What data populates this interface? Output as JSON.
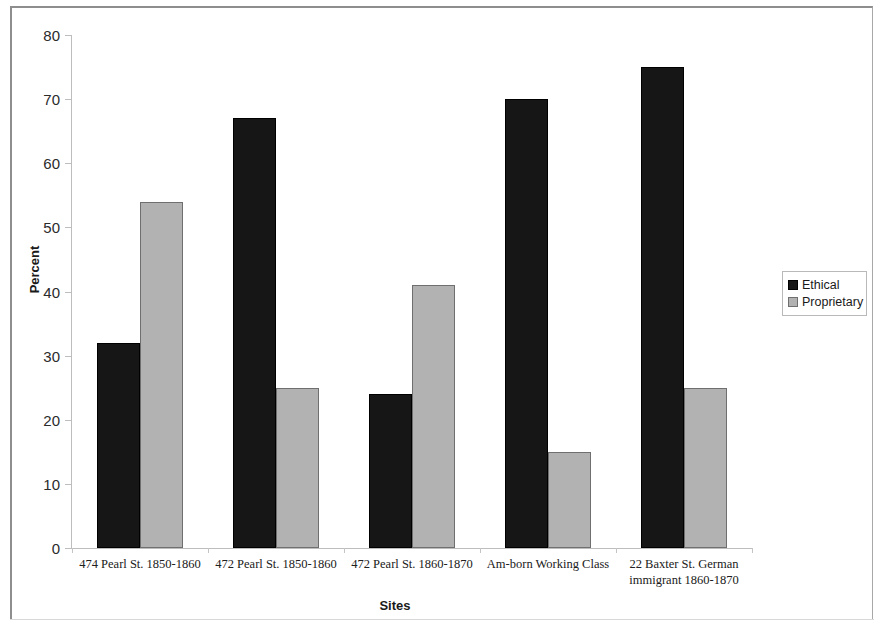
{
  "chart_data": {
    "type": "bar",
    "title": "",
    "xlabel": "Sites",
    "ylabel": "Percent",
    "ylim": [
      0,
      80
    ],
    "ytick_step": 10,
    "yticks": [
      "80",
      "70",
      "60",
      "50",
      "40",
      "30",
      "20",
      "10",
      "0"
    ],
    "grid": false,
    "legend_position": "right",
    "categories": [
      "474 Pearl St. 1850-1860",
      "472 Pearl St. 1850-1860",
      "472 Pearl St. 1860-1870",
      "Am-born Working Class",
      "22 Baxter St. German immigrant 1860-1870"
    ],
    "series": [
      {
        "name": "Ethical",
        "color": "#161616",
        "values": [
          32,
          67,
          24,
          70,
          75
        ]
      },
      {
        "name": "Proprietary",
        "color": "#b2b2b2",
        "values": [
          54,
          25,
          41,
          15,
          25
        ]
      }
    ]
  },
  "legend": {
    "items": [
      {
        "label": "Ethical"
      },
      {
        "label": "Proprietary"
      }
    ]
  }
}
